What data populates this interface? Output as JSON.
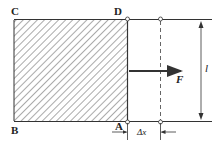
{
  "diagram": {
    "labels": {
      "C": "C",
      "D": "D",
      "B": "B",
      "A": "A",
      "force": "F",
      "length": "l",
      "displacement": "Δx"
    },
    "colors": {
      "line": "#333333",
      "hatch": "#555555",
      "background": "#ffffff"
    },
    "elements": [
      {
        "type": "hatched-rectangle",
        "corners": [
          "C",
          "D",
          "A",
          "B"
        ]
      },
      {
        "type": "rail",
        "position": "top"
      },
      {
        "type": "rail",
        "position": "bottom"
      },
      {
        "type": "rod",
        "edge": "DA"
      },
      {
        "type": "dashed-rod",
        "meaning": "displaced position"
      },
      {
        "type": "arrow",
        "label": "F",
        "direction": "right"
      },
      {
        "type": "dimension",
        "label": "l",
        "orientation": "vertical"
      },
      {
        "type": "dimension",
        "label": "Δx",
        "orientation": "horizontal"
      }
    ]
  }
}
